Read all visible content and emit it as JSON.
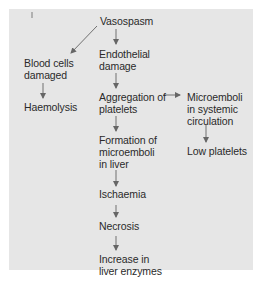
{
  "diagram": {
    "type": "flowchart",
    "background_color": "#e6e6e6",
    "text_color": "#2a2a2a",
    "arrow_color": "#666666",
    "nodes": {
      "vasospasm": "Vasospasm",
      "blood_cells_damaged": "Blood cells\ndamaged",
      "haemolysis": "Haemolysis",
      "endothelial_damage": "Endothelial\ndamage",
      "aggregation_of_platelets": "Aggregation of\nplatelets",
      "microemboli_systemic": "Microemboli\nin systemic\ncirculation",
      "low_platelets": "Low platelets",
      "formation_microemboli_liver": "Formation of\nmicroemboli\nin liver",
      "ischaemia": "Ischaemia",
      "necrosis": "Necrosis",
      "increase_liver_enzymes": "Increase in\nliver enzymes"
    },
    "edges": [
      {
        "from": "Vasospasm",
        "to": "Blood cells damaged"
      },
      {
        "from": "Vasospasm",
        "to": "Endothelial damage"
      },
      {
        "from": "Blood cells damaged",
        "to": "Haemolysis"
      },
      {
        "from": "Endothelial damage",
        "to": "Aggregation of platelets"
      },
      {
        "from": "Aggregation of platelets",
        "to": "Microemboli in systemic circulation"
      },
      {
        "from": "Microemboli in systemic circulation",
        "to": "Low platelets"
      },
      {
        "from": "Aggregation of platelets",
        "to": "Formation of microemboli in liver"
      },
      {
        "from": "Formation of microemboli in liver",
        "to": "Ischaemia"
      },
      {
        "from": "Ischaemia",
        "to": "Necrosis"
      },
      {
        "from": "Necrosis",
        "to": "Increase in liver enzymes"
      }
    ]
  }
}
